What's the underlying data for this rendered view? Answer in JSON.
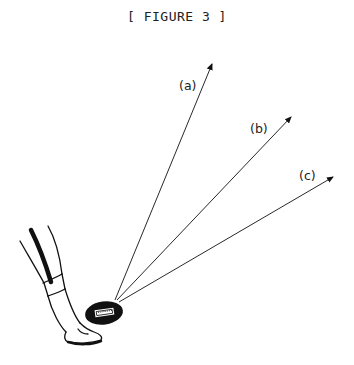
{
  "caption": "[ FIGURE 3 ]",
  "diagram": {
    "origin": {
      "x": 115,
      "y": 300
    },
    "arrows": [
      {
        "id": "a",
        "label": "(a)",
        "tip": {
          "x": 212,
          "y": 64
        },
        "label_pos": {
          "x": 179,
          "y": 90
        }
      },
      {
        "id": "b",
        "label": "(b)",
        "tip": {
          "x": 291,
          "y": 117
        },
        "label_pos": {
          "x": 250,
          "y": 133
        }
      },
      {
        "id": "c",
        "label": "(c)",
        "tip": {
          "x": 333,
          "y": 177
        },
        "label_pos": {
          "x": 299,
          "y": 180
        }
      }
    ],
    "colors": {
      "ink": "#111111",
      "background": "#ffffff"
    }
  }
}
